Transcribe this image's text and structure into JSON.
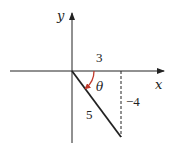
{
  "diagram": {
    "type": "coordinate-triangle",
    "axes": {
      "x_label": "x",
      "y_label": "y"
    },
    "labels": {
      "adjacent": "3",
      "opposite": "−4",
      "hypotenuse": "5",
      "angle": "θ"
    },
    "colors": {
      "axis": "#222222",
      "hypotenuse": "#222222",
      "angle_arc": "#c0392b",
      "dashed_line": "#222222"
    },
    "terminal_point": {
      "x": 3,
      "y": -4
    }
  }
}
